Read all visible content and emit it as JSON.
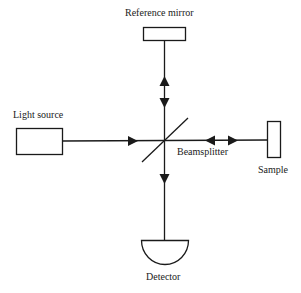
{
  "diagram": {
    "type": "michelson-interferometer",
    "colors": {
      "stroke": "#1a1a1a",
      "background": "#ffffff"
    },
    "labels": {
      "reference_mirror": "Reference mirror",
      "light_source": "Light source",
      "beamsplitter": "Beamsplitter",
      "sample": "Sample",
      "detector": "Detector"
    },
    "components": [
      {
        "id": "reference-mirror",
        "shape": "rectangle"
      },
      {
        "id": "light-source",
        "shape": "rectangle"
      },
      {
        "id": "beamsplitter",
        "shape": "diagonal-line"
      },
      {
        "id": "sample",
        "shape": "rectangle"
      },
      {
        "id": "detector",
        "shape": "semicircle"
      }
    ],
    "arrows": [
      {
        "from": "light-source",
        "to": "beamsplitter",
        "direction": "right"
      },
      {
        "between": "beamsplitter",
        "and": "reference-mirror",
        "direction": "bidirectional"
      },
      {
        "between": "beamsplitter",
        "and": "sample",
        "direction": "bidirectional"
      },
      {
        "from": "beamsplitter",
        "to": "detector",
        "direction": "down"
      }
    ]
  }
}
